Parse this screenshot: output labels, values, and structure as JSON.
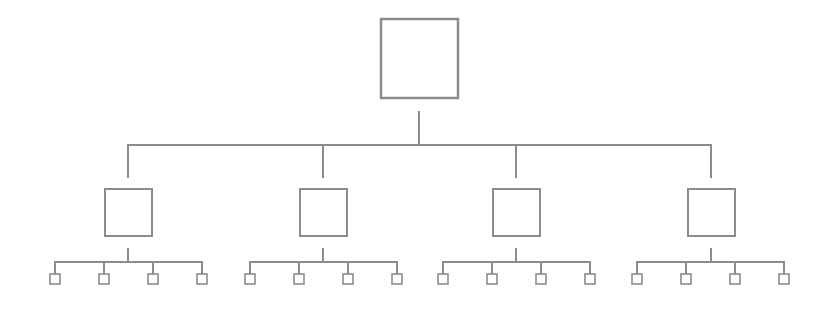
{
  "diagram": {
    "type": "tree-hierarchy",
    "stroke_color": "#8c8c8c",
    "fill_color": "#ffffff",
    "levels": 3,
    "root": {
      "label": "",
      "box": {
        "x": 381,
        "y": 19,
        "w": 77,
        "h": 79
      },
      "stem": {
        "x": 419,
        "y1": 112,
        "y2": 145
      }
    },
    "level1_bar": {
      "y": 145,
      "x1": 128,
      "x2": 711
    },
    "children": [
      {
        "label": "",
        "cx": 128,
        "drop": {
          "y1": 145,
          "y2": 177
        },
        "box": {
          "x": 105,
          "y": 189,
          "w": 47,
          "h": 47
        },
        "stem": {
          "y1": 249,
          "y2": 262
        },
        "bar": {
          "y": 262,
          "x1": 55,
          "x2": 202
        },
        "leaves": [
          {
            "label": "",
            "cx": 55
          },
          {
            "label": "",
            "cx": 104
          },
          {
            "label": "",
            "cx": 153
          },
          {
            "label": "",
            "cx": 202
          }
        ]
      },
      {
        "label": "",
        "cx": 323,
        "drop": {
          "y1": 145,
          "y2": 177
        },
        "box": {
          "x": 300,
          "y": 189,
          "w": 47,
          "h": 47
        },
        "stem": {
          "y1": 249,
          "y2": 262
        },
        "bar": {
          "y": 262,
          "x1": 250,
          "x2": 397
        },
        "leaves": [
          {
            "label": "",
            "cx": 250
          },
          {
            "label": "",
            "cx": 299
          },
          {
            "label": "",
            "cx": 348
          },
          {
            "label": "",
            "cx": 397
          }
        ]
      },
      {
        "label": "",
        "cx": 516,
        "drop": {
          "y1": 145,
          "y2": 177
        },
        "box": {
          "x": 493,
          "y": 189,
          "w": 47,
          "h": 47
        },
        "stem": {
          "y1": 249,
          "y2": 262
        },
        "bar": {
          "y": 262,
          "x1": 443,
          "x2": 590
        },
        "leaves": [
          {
            "label": "",
            "cx": 443
          },
          {
            "label": "",
            "cx": 492
          },
          {
            "label": "",
            "cx": 541
          },
          {
            "label": "",
            "cx": 590
          }
        ]
      },
      {
        "label": "",
        "cx": 711,
        "drop": {
          "y1": 145,
          "y2": 177
        },
        "box": {
          "x": 688,
          "y": 189,
          "w": 47,
          "h": 47
        },
        "stem": {
          "y1": 249,
          "y2": 262
        },
        "bar": {
          "y": 262,
          "x1": 637,
          "x2": 784
        },
        "leaves": [
          {
            "label": "",
            "cx": 637
          },
          {
            "label": "",
            "cx": 686
          },
          {
            "label": "",
            "cx": 735
          },
          {
            "label": "",
            "cx": 784
          }
        ]
      }
    ],
    "leaf_box": {
      "size": 10,
      "y": 274,
      "drop_y1": 262,
      "drop_y2": 274
    }
  }
}
